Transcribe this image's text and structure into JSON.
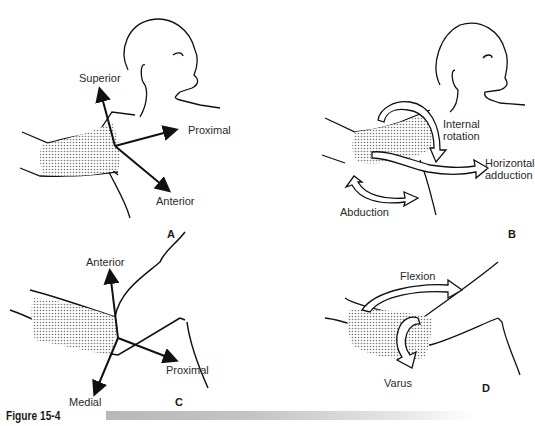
{
  "figure": {
    "caption": "Figure 15-4",
    "panels": {
      "A": {
        "label": "A",
        "axes": [
          "Superior",
          "Proximal",
          "Anterior"
        ]
      },
      "B": {
        "label": "B",
        "motions": [
          "Internal rotation",
          "Horizontal adduction",
          "Abduction"
        ],
        "internal_rotation_line1": "Internal",
        "internal_rotation_line2": "rotation",
        "horizontal_adduction_line1": "Horizontal",
        "horizontal_adduction_line2": "adduction",
        "abduction": "Abduction"
      },
      "C": {
        "label": "C",
        "axes": [
          "Anterior",
          "Medial",
          "Proximal"
        ]
      },
      "D": {
        "label": "D",
        "motions": [
          "Flexion",
          "Varus"
        ]
      }
    }
  }
}
